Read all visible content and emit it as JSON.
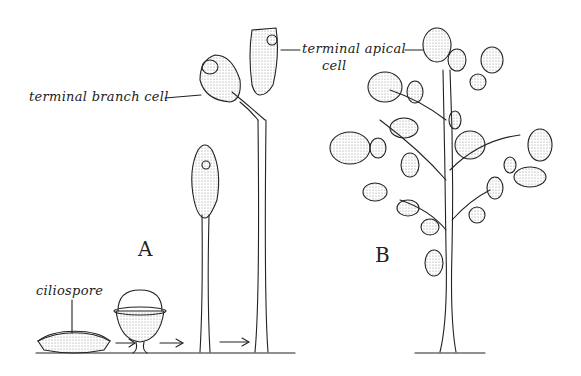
{
  "figure": {
    "panel_a_label": "A",
    "panel_b_label": "B",
    "labels": {
      "ciliospore": "ciliospore",
      "terminal_branch_cell": "terminal branch cell",
      "terminal_apical_cell_line1": "terminal apical",
      "terminal_apical_cell_line2": "cell"
    },
    "colors": {
      "ink": "#222222",
      "background": "#ffffff",
      "stipple": "#888888"
    }
  }
}
